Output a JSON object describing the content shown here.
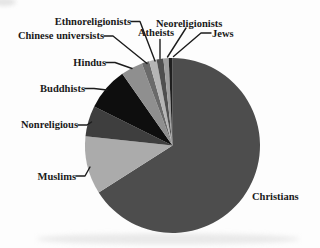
{
  "figure": {
    "background_color": "#fdfdfd",
    "text_color": "#1a1a1a"
  },
  "chart_data": {
    "type": "pie",
    "title": "",
    "legend_position": "none (direct slice labels with leader lines)",
    "start_angle": "12 o'clock",
    "direction": "clockwise",
    "geometry": {
      "cx": 172.5,
      "cy": 145.5,
      "r": 87.5
    },
    "slices": [
      {
        "id": "christians",
        "label": "Christians",
        "percent": 66.0,
        "angle_deg": 237.5,
        "color": "#4d4d4d"
      },
      {
        "id": "muslims",
        "label": "Muslims",
        "percent": 10.7,
        "angle_deg": 38.5,
        "color": "#ababab"
      },
      {
        "id": "nonreligious",
        "label": "Nonreligious",
        "percent": 5.7,
        "angle_deg": 20.5,
        "color": "#3e3e3e"
      },
      {
        "id": "buddhists",
        "label": "Buddhists",
        "percent": 7.9,
        "angle_deg": 28.5,
        "color": "#0e0e0e"
      },
      {
        "id": "hindus",
        "label": "Hindus",
        "percent": 4.0,
        "angle_deg": 14.5,
        "color": "#8f8f8f"
      },
      {
        "id": "chinese-universists",
        "label": "Chinese universists",
        "percent": 1.4,
        "angle_deg": 5.0,
        "color": "#6a6a6a"
      },
      {
        "id": "ethnoreligionists",
        "label": "Ethnoreligionists",
        "percent": 1.4,
        "angle_deg": 5.0,
        "color": "#b5b5b5"
      },
      {
        "id": "atheists",
        "label": "Atheists",
        "percent": 1.2,
        "angle_deg": 4.5,
        "color": "#4f4f4f"
      },
      {
        "id": "neoreligionists",
        "label": "Neoreligionists",
        "percent": 1.0,
        "angle_deg": 3.5,
        "color": "#9e9e9e"
      },
      {
        "id": "jews",
        "label": "Jews",
        "percent": 0.7,
        "angle_deg": 2.5,
        "color": "#1f1f1f"
      }
    ]
  }
}
